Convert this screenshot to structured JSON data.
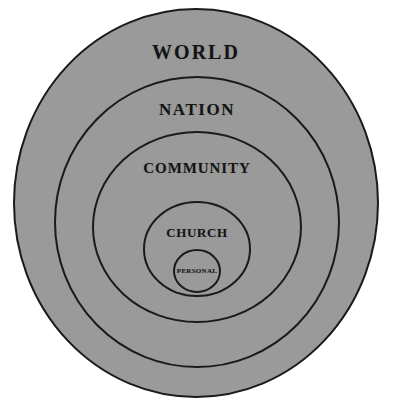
{
  "diagram": {
    "type": "concentric-circles",
    "background_color": "#ffffff",
    "fill_color": "#9a9a9a",
    "stroke_color": "#1a1a1a",
    "rings": [
      {
        "id": "world",
        "label": "WORLD",
        "level": 1,
        "cx": 196,
        "cy": 203,
        "rx": 182,
        "ry": 194,
        "label_x": 196,
        "label_y": 52,
        "fill": "#9a9a9a",
        "stroke": "#1a1a1a",
        "stroke_width": 2
      },
      {
        "id": "nation",
        "label": "NATION",
        "level": 2,
        "cx": 197,
        "cy": 222,
        "rx": 142,
        "ry": 145,
        "label_x": 197,
        "label_y": 110,
        "fill": "#9a9a9a",
        "stroke": "#1a1a1a",
        "stroke_width": 2
      },
      {
        "id": "community",
        "label": "COMMUNITY",
        "level": 3,
        "cx": 197,
        "cy": 227,
        "rx": 104,
        "ry": 95,
        "label_x": 197,
        "label_y": 168,
        "fill": "#9a9a9a",
        "stroke": "#1a1a1a",
        "stroke_width": 2
      },
      {
        "id": "church",
        "label": "CHURCH",
        "level": 4,
        "cx": 197,
        "cy": 249,
        "rx": 53,
        "ry": 47,
        "label_x": 197,
        "label_y": 233,
        "fill": "#9a9a9a",
        "stroke": "#1a1a1a",
        "stroke_width": 2
      },
      {
        "id": "personal",
        "label": "PERSONAL",
        "level": 5,
        "cx": 197,
        "cy": 271,
        "rx": 23,
        "ry": 21,
        "label_x": 197,
        "label_y": 271,
        "fill": "#9a9a9a",
        "stroke": "#1a1a1a",
        "stroke_width": 2
      }
    ]
  }
}
